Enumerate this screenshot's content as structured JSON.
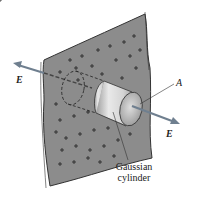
{
  "diagram": {
    "labels": {
      "field_left": "E",
      "field_right": "E",
      "area": "A",
      "cylinder_line1": "Gaussian",
      "cylinder_line2": "cylinder"
    },
    "colors": {
      "sheet": "#8c8c8c",
      "sheet_edge": "#ffffff",
      "outline": "#333333",
      "arrow": "#6f7f8f",
      "cylinder_light": "#e8e8e8",
      "cylinder_dark": "#a9a9a9"
    }
  }
}
